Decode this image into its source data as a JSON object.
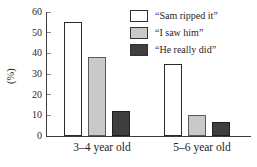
{
  "chart_data": {
    "type": "bar",
    "title": "",
    "xlabel": "",
    "ylabel": "(%)",
    "ylim": [
      0,
      60
    ],
    "yticks": [
      0,
      10,
      20,
      30,
      40,
      50,
      60
    ],
    "grid": false,
    "legend_position": "top-right",
    "categories": [
      "3–4 year old",
      "5–6 year old"
    ],
    "series": [
      {
        "name": "“Sam ripped it”",
        "fill": "#ffffff",
        "border": "#2b2b2b",
        "values": [
          55,
          35
        ]
      },
      {
        "name": "“I saw him”",
        "fill": "#c9c9c9",
        "border": "#5a5a5a",
        "values": [
          38,
          10
        ]
      },
      {
        "name": "“He really did”",
        "fill": "#3f3f3f",
        "border": "#1f1f1f",
        "values": [
          12,
          7
        ]
      }
    ]
  }
}
